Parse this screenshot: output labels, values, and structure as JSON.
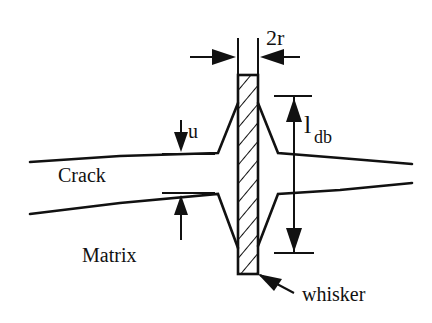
{
  "diagram": {
    "labels": {
      "width": "2r",
      "displacement": "u",
      "debond_length_main": "l",
      "debond_length_sub": "db",
      "crack": "Crack",
      "matrix": "Matrix",
      "whisker": "whisker"
    },
    "colors": {
      "ink": "#111111",
      "background": "#ffffff"
    }
  }
}
